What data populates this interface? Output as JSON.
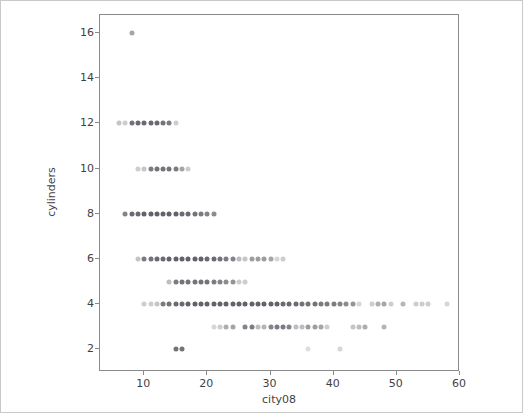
{
  "chart_data": {
    "type": "scatter",
    "title": "",
    "xlabel": "city08",
    "ylabel": "cylinders",
    "xlim": [
      3,
      60
    ],
    "ylim": [
      1,
      16.8
    ],
    "grid": false,
    "legend": null,
    "marker": {
      "shape": "circle",
      "color": "#5a5a63",
      "base_size_px": 5,
      "alpha_blended": true
    },
    "xticks": [
      10,
      20,
      30,
      40,
      50,
      60
    ],
    "yticks": [
      2,
      4,
      6,
      8,
      10,
      12,
      14,
      16
    ],
    "points": [
      {
        "x": 8,
        "y": 16,
        "a": 0.55
      },
      {
        "x": 6,
        "y": 12,
        "a": 0.35
      },
      {
        "x": 7,
        "y": 12,
        "a": 0.3
      },
      {
        "x": 8,
        "y": 12,
        "a": 0.85
      },
      {
        "x": 9,
        "y": 12,
        "a": 0.9
      },
      {
        "x": 10,
        "y": 12,
        "a": 0.9
      },
      {
        "x": 11,
        "y": 12,
        "a": 0.9
      },
      {
        "x": 12,
        "y": 12,
        "a": 0.9
      },
      {
        "x": 13,
        "y": 12,
        "a": 0.85
      },
      {
        "x": 14,
        "y": 12,
        "a": 0.8
      },
      {
        "x": 15,
        "y": 12,
        "a": 0.3
      },
      {
        "x": 9,
        "y": 10,
        "a": 0.3
      },
      {
        "x": 10,
        "y": 10,
        "a": 0.35
      },
      {
        "x": 11,
        "y": 10,
        "a": 0.8
      },
      {
        "x": 12,
        "y": 10,
        "a": 0.85
      },
      {
        "x": 13,
        "y": 10,
        "a": 0.85
      },
      {
        "x": 14,
        "y": 10,
        "a": 0.85
      },
      {
        "x": 15,
        "y": 10,
        "a": 0.8
      },
      {
        "x": 16,
        "y": 10,
        "a": 0.55
      },
      {
        "x": 17,
        "y": 10,
        "a": 0.3
      },
      {
        "x": 7,
        "y": 8,
        "a": 0.75
      },
      {
        "x": 8,
        "y": 8,
        "a": 0.9
      },
      {
        "x": 9,
        "y": 8,
        "a": 0.9
      },
      {
        "x": 10,
        "y": 8,
        "a": 0.95
      },
      {
        "x": 11,
        "y": 8,
        "a": 0.95
      },
      {
        "x": 12,
        "y": 8,
        "a": 0.95
      },
      {
        "x": 13,
        "y": 8,
        "a": 0.95
      },
      {
        "x": 14,
        "y": 8,
        "a": 0.95
      },
      {
        "x": 15,
        "y": 8,
        "a": 0.95
      },
      {
        "x": 16,
        "y": 8,
        "a": 0.9
      },
      {
        "x": 17,
        "y": 8,
        "a": 0.9
      },
      {
        "x": 18,
        "y": 8,
        "a": 0.85
      },
      {
        "x": 19,
        "y": 8,
        "a": 0.8
      },
      {
        "x": 20,
        "y": 8,
        "a": 0.75
      },
      {
        "x": 21,
        "y": 8,
        "a": 0.7
      },
      {
        "x": 9,
        "y": 6,
        "a": 0.35
      },
      {
        "x": 10,
        "y": 6,
        "a": 0.8
      },
      {
        "x": 11,
        "y": 6,
        "a": 0.85
      },
      {
        "x": 12,
        "y": 6,
        "a": 0.9
      },
      {
        "x": 13,
        "y": 6,
        "a": 0.9
      },
      {
        "x": 14,
        "y": 6,
        "a": 0.95
      },
      {
        "x": 15,
        "y": 6,
        "a": 0.95
      },
      {
        "x": 16,
        "y": 6,
        "a": 0.95
      },
      {
        "x": 17,
        "y": 6,
        "a": 0.95
      },
      {
        "x": 18,
        "y": 6,
        "a": 0.95
      },
      {
        "x": 19,
        "y": 6,
        "a": 0.95
      },
      {
        "x": 20,
        "y": 6,
        "a": 0.9
      },
      {
        "x": 21,
        "y": 6,
        "a": 0.9
      },
      {
        "x": 22,
        "y": 6,
        "a": 0.85
      },
      {
        "x": 23,
        "y": 6,
        "a": 0.8
      },
      {
        "x": 24,
        "y": 6,
        "a": 0.75
      },
      {
        "x": 25,
        "y": 6,
        "a": 0.4
      },
      {
        "x": 26,
        "y": 6,
        "a": 0.35
      },
      {
        "x": 27,
        "y": 6,
        "a": 0.6
      },
      {
        "x": 28,
        "y": 6,
        "a": 0.6
      },
      {
        "x": 29,
        "y": 6,
        "a": 0.6
      },
      {
        "x": 30,
        "y": 6,
        "a": 0.55
      },
      {
        "x": 31,
        "y": 6,
        "a": 0.25
      },
      {
        "x": 32,
        "y": 6,
        "a": 0.3
      },
      {
        "x": 14,
        "y": 5,
        "a": 0.4
      },
      {
        "x": 15,
        "y": 5,
        "a": 0.8
      },
      {
        "x": 16,
        "y": 5,
        "a": 0.85
      },
      {
        "x": 17,
        "y": 5,
        "a": 0.85
      },
      {
        "x": 18,
        "y": 5,
        "a": 0.85
      },
      {
        "x": 19,
        "y": 5,
        "a": 0.85
      },
      {
        "x": 20,
        "y": 5,
        "a": 0.85
      },
      {
        "x": 21,
        "y": 5,
        "a": 0.8
      },
      {
        "x": 22,
        "y": 5,
        "a": 0.75
      },
      {
        "x": 23,
        "y": 5,
        "a": 0.7
      },
      {
        "x": 24,
        "y": 5,
        "a": 0.65
      },
      {
        "x": 25,
        "y": 5,
        "a": 0.3
      },
      {
        "x": 26,
        "y": 5,
        "a": 0.3
      },
      {
        "x": 10,
        "y": 4,
        "a": 0.3
      },
      {
        "x": 11,
        "y": 4,
        "a": 0.3
      },
      {
        "x": 12,
        "y": 4,
        "a": 0.35
      },
      {
        "x": 13,
        "y": 4,
        "a": 0.8
      },
      {
        "x": 14,
        "y": 4,
        "a": 0.85
      },
      {
        "x": 15,
        "y": 4,
        "a": 0.9
      },
      {
        "x": 16,
        "y": 4,
        "a": 0.9
      },
      {
        "x": 17,
        "y": 4,
        "a": 0.95
      },
      {
        "x": 18,
        "y": 4,
        "a": 0.95
      },
      {
        "x": 19,
        "y": 4,
        "a": 0.95
      },
      {
        "x": 20,
        "y": 4,
        "a": 0.95
      },
      {
        "x": 21,
        "y": 4,
        "a": 0.95
      },
      {
        "x": 22,
        "y": 4,
        "a": 0.95
      },
      {
        "x": 23,
        "y": 4,
        "a": 0.95
      },
      {
        "x": 24,
        "y": 4,
        "a": 0.95
      },
      {
        "x": 25,
        "y": 4,
        "a": 0.95
      },
      {
        "x": 26,
        "y": 4,
        "a": 0.95
      },
      {
        "x": 27,
        "y": 4,
        "a": 0.95
      },
      {
        "x": 28,
        "y": 4,
        "a": 0.95
      },
      {
        "x": 29,
        "y": 4,
        "a": 0.95
      },
      {
        "x": 30,
        "y": 4,
        "a": 0.95
      },
      {
        "x": 31,
        "y": 4,
        "a": 0.95
      },
      {
        "x": 32,
        "y": 4,
        "a": 0.9
      },
      {
        "x": 33,
        "y": 4,
        "a": 0.9
      },
      {
        "x": 34,
        "y": 4,
        "a": 0.9
      },
      {
        "x": 35,
        "y": 4,
        "a": 0.85
      },
      {
        "x": 36,
        "y": 4,
        "a": 0.85
      },
      {
        "x": 37,
        "y": 4,
        "a": 0.85
      },
      {
        "x": 38,
        "y": 4,
        "a": 0.8
      },
      {
        "x": 39,
        "y": 4,
        "a": 0.8
      },
      {
        "x": 40,
        "y": 4,
        "a": 0.8
      },
      {
        "x": 41,
        "y": 4,
        "a": 0.75
      },
      {
        "x": 42,
        "y": 4,
        "a": 0.7
      },
      {
        "x": 43,
        "y": 4,
        "a": 0.65
      },
      {
        "x": 44,
        "y": 4,
        "a": 0.25
      },
      {
        "x": 46,
        "y": 4,
        "a": 0.3
      },
      {
        "x": 47,
        "y": 4,
        "a": 0.5
      },
      {
        "x": 48,
        "y": 4,
        "a": 0.55
      },
      {
        "x": 49,
        "y": 4,
        "a": 0.3
      },
      {
        "x": 51,
        "y": 4,
        "a": 0.45
      },
      {
        "x": 53,
        "y": 4,
        "a": 0.3
      },
      {
        "x": 54,
        "y": 4,
        "a": 0.3
      },
      {
        "x": 55,
        "y": 4,
        "a": 0.3
      },
      {
        "x": 58,
        "y": 4,
        "a": 0.25
      },
      {
        "x": 21,
        "y": 3,
        "a": 0.25
      },
      {
        "x": 22,
        "y": 3,
        "a": 0.3
      },
      {
        "x": 23,
        "y": 3,
        "a": 0.5
      },
      {
        "x": 24,
        "y": 3,
        "a": 0.55
      },
      {
        "x": 26,
        "y": 3,
        "a": 0.75
      },
      {
        "x": 27,
        "y": 3,
        "a": 0.8
      },
      {
        "x": 28,
        "y": 3,
        "a": 0.4
      },
      {
        "x": 29,
        "y": 3,
        "a": 0.45
      },
      {
        "x": 30,
        "y": 3,
        "a": 0.75
      },
      {
        "x": 31,
        "y": 3,
        "a": 0.8
      },
      {
        "x": 32,
        "y": 3,
        "a": 0.8
      },
      {
        "x": 33,
        "y": 3,
        "a": 0.75
      },
      {
        "x": 34,
        "y": 3,
        "a": 0.4
      },
      {
        "x": 35,
        "y": 3,
        "a": 0.4
      },
      {
        "x": 36,
        "y": 3,
        "a": 0.6
      },
      {
        "x": 37,
        "y": 3,
        "a": 0.6
      },
      {
        "x": 38,
        "y": 3,
        "a": 0.55
      },
      {
        "x": 39,
        "y": 3,
        "a": 0.3
      },
      {
        "x": 43,
        "y": 3,
        "a": 0.35
      },
      {
        "x": 44,
        "y": 3,
        "a": 0.4
      },
      {
        "x": 45,
        "y": 3,
        "a": 0.5
      },
      {
        "x": 48,
        "y": 3,
        "a": 0.45
      },
      {
        "x": 15,
        "y": 2,
        "a": 0.85
      },
      {
        "x": 16,
        "y": 2,
        "a": 0.85
      },
      {
        "x": 36,
        "y": 2,
        "a": 0.2
      },
      {
        "x": 41,
        "y": 2,
        "a": 0.25
      }
    ]
  },
  "axes": {
    "x": {
      "label": "city08",
      "ticks": [
        "10",
        "20",
        "30",
        "40",
        "50",
        "60"
      ]
    },
    "y": {
      "label": "cylinders",
      "ticks": [
        "2",
        "4",
        "6",
        "8",
        "10",
        "12",
        "14",
        "16"
      ]
    }
  }
}
